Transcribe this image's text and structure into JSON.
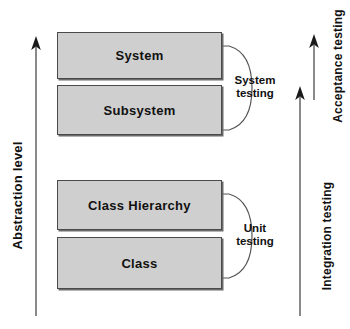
{
  "diagram": {
    "colors": {
      "box_fill": "#cfcfcf",
      "box_border": "#4a4a4a",
      "box_shadow": "#6b6b6b",
      "text": "#111111",
      "axis_line": "#8a8a8a",
      "brace_line": "#555555",
      "background": "#ffffff"
    },
    "axes": {
      "left": {
        "label": "Abstraction level",
        "direction": "up"
      },
      "right_inner": {
        "label": "Integration testing",
        "direction": "up"
      },
      "right_outer": {
        "label": "Acceptance testing",
        "direction": "up"
      }
    },
    "boxes": [
      {
        "label": "System"
      },
      {
        "label": "Subsystem"
      },
      {
        "label": "Class Hierarchy"
      },
      {
        "label": "Class"
      }
    ],
    "braces": [
      {
        "label_line1": "System",
        "label_line2": "testing",
        "spans": [
          "System",
          "Subsystem"
        ]
      },
      {
        "label_line1": "Unit",
        "label_line2": "testing",
        "spans": [
          "Class Hierarchy",
          "Class"
        ]
      }
    ]
  }
}
